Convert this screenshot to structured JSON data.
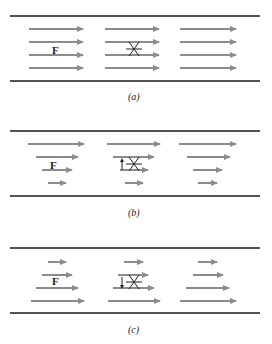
{
  "figure": {
    "arrow_color": "#8c8c8c",
    "wall_color": "#1a1a1a",
    "panels": [
      {
        "id": "a",
        "caption": "(a)",
        "force_label": "F",
        "paddle_rotation": "none",
        "description": "uniform flow - all arrows equal length"
      },
      {
        "id": "b",
        "caption": "(b)",
        "force_label": "F",
        "paddle_rotation": "counterclockwise (up arrow)",
        "description": "velocity increases toward top wall"
      },
      {
        "id": "c",
        "caption": "(c)",
        "force_label": "F",
        "paddle_rotation": "clockwise (down arrow)",
        "description": "velocity increases toward bottom wall"
      }
    ]
  }
}
